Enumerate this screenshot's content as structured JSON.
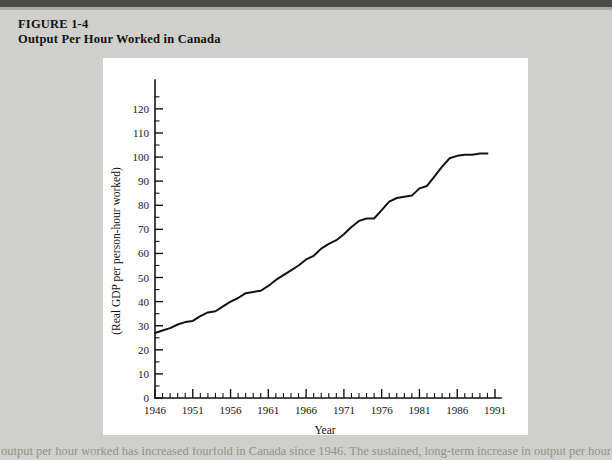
{
  "figure": {
    "label": "FIGURE 1-4",
    "title": "Output Per Hour Worked in Canada"
  },
  "footer_text": "output per hour worked has increased fourfold in Canada since 1946. The sustained, long-term increase in output per hour",
  "colors": {
    "page_background": "#cfcfcb",
    "panel_background": "#ffffff",
    "ink": "#15130f",
    "top_rule": "#4a4a48"
  },
  "chart_data": {
    "type": "line",
    "title": "Output Per Hour Worked in Canada",
    "xlabel": "Year",
    "ylabel": "(Real GDP per person-hour worked)",
    "xlim": [
      1946,
      1991
    ],
    "ylim": [
      0,
      127
    ],
    "grid": false,
    "legend": null,
    "x_tick_labels": [
      1946,
      1951,
      1956,
      1961,
      1966,
      1971,
      1976,
      1981,
      1986,
      1991
    ],
    "x_tick_step_minor": 1,
    "y_tick_labels": [
      0,
      10,
      20,
      30,
      40,
      50,
      60,
      70,
      80,
      90,
      100,
      110,
      120
    ],
    "y_tick_step_minor": 5,
    "series": [
      {
        "name": "Real GDP per person-hour worked",
        "x": [
          1946,
          1947,
          1948,
          1949,
          1950,
          1951,
          1952,
          1953,
          1954,
          1955,
          1956,
          1957,
          1958,
          1959,
          1960,
          1961,
          1962,
          1963,
          1964,
          1965,
          1966,
          1967,
          1968,
          1969,
          1970,
          1971,
          1972,
          1973,
          1974,
          1975,
          1976,
          1977,
          1978,
          1979,
          1980,
          1981,
          1982,
          1983,
          1984,
          1985,
          1986,
          1987,
          1988,
          1989,
          1990
        ],
        "values": [
          27,
          28,
          29,
          30.5,
          31.5,
          32,
          34,
          35.5,
          36,
          38,
          40,
          41.5,
          43.5,
          44,
          44.5,
          46.5,
          49,
          51,
          53,
          55,
          57.5,
          59,
          62,
          64,
          65.5,
          68,
          71,
          73.5,
          74.5,
          74.5,
          78,
          81.5,
          83,
          83.5,
          84,
          87,
          88,
          92,
          96,
          99.5,
          100.5,
          101,
          101,
          101.5,
          101.5
        ]
      }
    ]
  }
}
